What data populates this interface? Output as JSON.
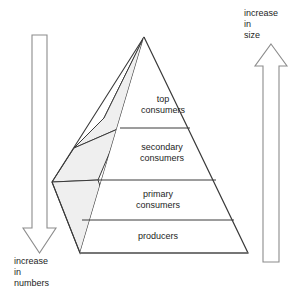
{
  "diagram": {
    "type": "ecological-pyramid",
    "title": "",
    "background_color": "#ffffff",
    "line_color": "#3a3a3a",
    "face_fill": "#efefef",
    "front_fill": "#ffffff",
    "text_color": "#1d1d1d"
  },
  "pyramid": {
    "tiers": [
      {
        "id": "top-consumers",
        "line1": "top",
        "line2": "consumers",
        "level": 4
      },
      {
        "id": "secondary-consumers",
        "line1": "secondary",
        "line2": "consumers",
        "level": 3
      },
      {
        "id": "primary-consumers",
        "line1": "primary",
        "line2": "consumers",
        "level": 2
      },
      {
        "id": "producers",
        "line1": "producers",
        "line2": "",
        "level": 1
      }
    ]
  },
  "arrows": {
    "left": {
      "id": "increase-in-numbers-arrow",
      "direction": "down",
      "label_lines": [
        "increase",
        "in",
        "numbers"
      ]
    },
    "right": {
      "id": "increase-in-size-arrow",
      "direction": "up",
      "label_lines": [
        "increase",
        "in",
        "size"
      ]
    }
  }
}
